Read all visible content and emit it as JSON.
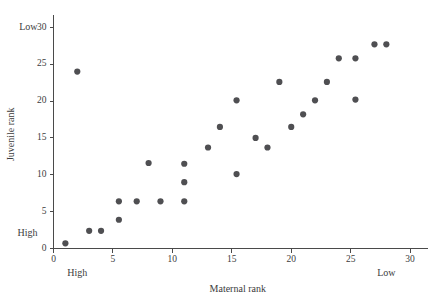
{
  "chart_data": {
    "type": "scatter",
    "title": "",
    "xlabel": "Maternal rank",
    "ylabel": "Juvenile rank",
    "xlim": [
      0,
      31
    ],
    "ylim": [
      0,
      31
    ],
    "grid": false,
    "legend": null,
    "xticks": [
      0,
      5,
      10,
      15,
      20,
      25,
      30
    ],
    "yticks": [
      0,
      5,
      10,
      15,
      20,
      25,
      30
    ],
    "xtick_labels": [
      "0",
      "5",
      "10",
      "15",
      "20",
      "25",
      "30"
    ],
    "ytick_labels": [
      "0",
      "5",
      "10",
      "15",
      "20",
      "25",
      "30"
    ],
    "x_axis_anchor_low": "High",
    "x_axis_anchor_high": "Low",
    "y_axis_anchor_low": "High",
    "y_axis_anchor_high": "Low",
    "x_anchor_low_at": 2,
    "x_anchor_high_at": 28,
    "y_anchor_low_at": 2,
    "y_anchor_high_at": 30,
    "marker_color": "#4f4f52",
    "marker_size": 3.1,
    "axis_color": "#4a4a4a",
    "background": "#ffffff",
    "x": [
      1,
      2,
      3,
      4,
      5.5,
      5.5,
      7,
      8,
      9,
      11,
      11,
      11,
      13,
      14,
      15.4,
      15.4,
      17,
      18,
      19,
      20,
      21,
      22,
      23,
      24,
      25.4,
      25.4,
      27,
      28
    ],
    "y": [
      0.7,
      24,
      2.4,
      2.4,
      3.9,
      6.4,
      6.4,
      11.6,
      6.4,
      6.4,
      9,
      11.5,
      13.7,
      16.5,
      10.1,
      20.1,
      15,
      13.7,
      22.6,
      16.5,
      18.2,
      20.1,
      22.6,
      25.8,
      20.2,
      25.8,
      27.7,
      27.7
    ],
    "points": [
      {
        "x": 1,
        "y": 0.7
      },
      {
        "x": 2,
        "y": 24
      },
      {
        "x": 3,
        "y": 2.4
      },
      {
        "x": 4,
        "y": 2.4
      },
      {
        "x": 5.5,
        "y": 3.9
      },
      {
        "x": 5.5,
        "y": 6.4
      },
      {
        "x": 7,
        "y": 6.4
      },
      {
        "x": 8,
        "y": 11.6
      },
      {
        "x": 9,
        "y": 6.4
      },
      {
        "x": 11,
        "y": 6.4
      },
      {
        "x": 11,
        "y": 9
      },
      {
        "x": 11,
        "y": 11.5
      },
      {
        "x": 13,
        "y": 13.7
      },
      {
        "x": 14,
        "y": 16.5
      },
      {
        "x": 15.4,
        "y": 10.1
      },
      {
        "x": 15.4,
        "y": 20.1
      },
      {
        "x": 17,
        "y": 15
      },
      {
        "x": 18,
        "y": 13.7
      },
      {
        "x": 19,
        "y": 22.6
      },
      {
        "x": 20,
        "y": 16.5
      },
      {
        "x": 21,
        "y": 18.2
      },
      {
        "x": 22,
        "y": 20.1
      },
      {
        "x": 23,
        "y": 22.6
      },
      {
        "x": 24,
        "y": 25.8
      },
      {
        "x": 25.4,
        "y": 20.2
      },
      {
        "x": 25.4,
        "y": 25.8
      },
      {
        "x": 27,
        "y": 27.7
      },
      {
        "x": 28,
        "y": 27.7
      }
    ]
  }
}
